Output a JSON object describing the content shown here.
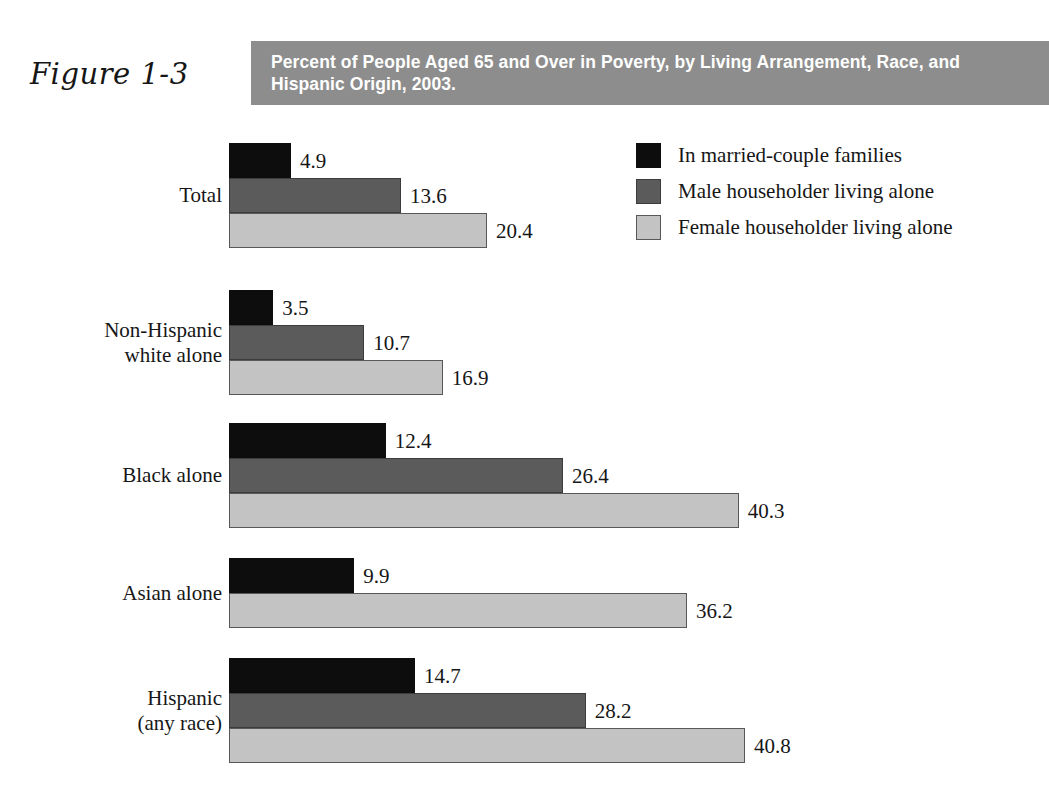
{
  "header": {
    "figure_number": "Figure 1-3",
    "title": "Percent of People Aged 65 and Over in Poverty, by Living Arrangement, Race, and Hispanic Origin, 2003.",
    "band_color": "#8d8d8d"
  },
  "legend": {
    "items": [
      {
        "label": "In married-couple families",
        "color": "#0d0d0d"
      },
      {
        "label": "Male householder living alone",
        "color": "#5b5b5b"
      },
      {
        "label": "Female householder living alone",
        "color": "#c3c3c3"
      }
    ]
  },
  "chart_data": {
    "type": "bar",
    "orientation": "horizontal",
    "title": "Percent of People Aged 65 and Over in Poverty, by Living Arrangement, Race, and Hispanic Origin, 2003.",
    "xlabel": "",
    "ylabel": "",
    "xlim": [
      0,
      42
    ],
    "grid": false,
    "legend_position": "top-right",
    "units": "percent",
    "categories": [
      "Total",
      "Non-Hispanic\nwhite alone",
      "Black alone",
      "Asian alone",
      "Hispanic\n(any race)"
    ],
    "series": [
      {
        "name": "In married-couple families",
        "color": "#0d0d0d",
        "values": [
          4.9,
          3.5,
          12.4,
          9.9,
          14.7
        ]
      },
      {
        "name": "Male householder living alone",
        "color": "#5b5b5b",
        "values": [
          13.6,
          10.7,
          26.4,
          null,
          28.2
        ]
      },
      {
        "name": "Female householder living alone",
        "color": "#c3c3c3",
        "values": [
          20.4,
          16.9,
          40.3,
          36.2,
          40.8
        ]
      }
    ],
    "groups": [
      {
        "label": "Total",
        "bars": [
          {
            "series": "In married-couple families",
            "value": 4.9,
            "label": "4.9"
          },
          {
            "series": "Male householder living alone",
            "value": 13.6,
            "label": "13.6"
          },
          {
            "series": "Female householder living alone",
            "value": 20.4,
            "label": "20.4"
          }
        ]
      },
      {
        "label": "Non-Hispanic\nwhite alone",
        "bars": [
          {
            "series": "In married-couple families",
            "value": 3.5,
            "label": "3.5"
          },
          {
            "series": "Male householder living alone",
            "value": 10.7,
            "label": "10.7"
          },
          {
            "series": "Female householder living alone",
            "value": 16.9,
            "label": "16.9"
          }
        ]
      },
      {
        "label": "Black alone",
        "bars": [
          {
            "series": "In married-couple families",
            "value": 12.4,
            "label": "12.4"
          },
          {
            "series": "Male householder living alone",
            "value": 26.4,
            "label": "26.4"
          },
          {
            "series": "Female householder living alone",
            "value": 40.3,
            "label": "40.3"
          }
        ]
      },
      {
        "label": "Asian alone",
        "bars": [
          {
            "series": "In married-couple families",
            "value": 9.9,
            "label": "9.9"
          },
          {
            "series": "Female householder living alone",
            "value": 36.2,
            "label": "36.2"
          }
        ]
      },
      {
        "label": "Hispanic\n(any race)",
        "bars": [
          {
            "series": "In married-couple families",
            "value": 14.7,
            "label": "14.7"
          },
          {
            "series": "Male householder living alone",
            "value": 28.2,
            "label": "28.2"
          },
          {
            "series": "Female householder living alone",
            "value": 40.8,
            "label": "40.8"
          }
        ]
      }
    ]
  },
  "layout": {
    "bar_origin_x": 229,
    "px_per_unit": 12.65,
    "bar_height": 35,
    "group_tops": [
      31,
      178,
      311,
      446,
      546
    ]
  }
}
